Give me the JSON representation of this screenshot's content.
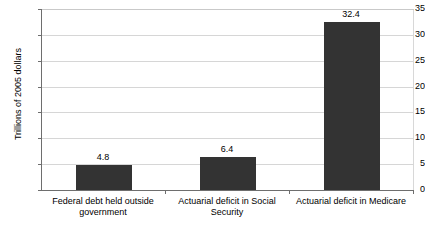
{
  "chart_data": {
    "type": "bar",
    "title": "",
    "xlabel": "",
    "ylabel": "Trillions of 2005 dollars",
    "ylim": [
      0,
      35
    ],
    "yticks": [
      0,
      5,
      10,
      15,
      20,
      25,
      30,
      35
    ],
    "ytick_labels": [
      "0",
      "5",
      "10",
      "15",
      "20",
      "25",
      "30",
      "35"
    ],
    "grid": true,
    "legend": false,
    "bar_color": "#333333",
    "background_color": "#ffffff",
    "categories": [
      "Federal debt held outside government",
      "Actuarial deficit in Social Security",
      "Actuarial deficit in Medicare"
    ],
    "category_lines": [
      [
        "Federal debt held outside",
        "government"
      ],
      [
        "Actuarial deficit in Social",
        "Security"
      ],
      [
        "Actuarial deficit in Medicare"
      ]
    ],
    "values": [
      4.8,
      6.4,
      32.4
    ],
    "value_labels": [
      "4.8",
      "6.4",
      "32.4"
    ]
  }
}
